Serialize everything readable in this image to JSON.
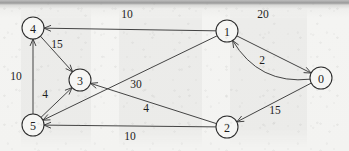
{
  "figure": {
    "kind": "directed-weighted-graph",
    "media": "scanned-book-page"
  },
  "nodes": [
    {
      "id": "0",
      "label": "0",
      "cx": 321,
      "cy": 78,
      "r": 11
    },
    {
      "id": "1",
      "label": "1",
      "cx": 227,
      "cy": 31,
      "r": 11
    },
    {
      "id": "2",
      "label": "2",
      "cx": 227,
      "cy": 127,
      "r": 11
    },
    {
      "id": "3",
      "label": "3",
      "cx": 80,
      "cy": 80,
      "r": 11
    },
    {
      "id": "4",
      "label": "4",
      "cx": 33,
      "cy": 28,
      "r": 11
    },
    {
      "id": "5",
      "label": "5",
      "cx": 33,
      "cy": 125,
      "r": 11
    }
  ],
  "edges": [
    {
      "id": "e-1-4",
      "from": "1",
      "to": "4",
      "weight": "10",
      "shape": "straight",
      "label_x": 127,
      "label_y": 14
    },
    {
      "id": "e-0-1",
      "from": "0",
      "to": "1",
      "weight": "20",
      "shape": "curved",
      "label_x": 263,
      "label_y": 14
    },
    {
      "id": "e-1-0",
      "from": "1",
      "to": "0",
      "weight": "2",
      "shape": "straight",
      "label_x": 262,
      "label_y": 60
    },
    {
      "id": "e-4-3",
      "from": "4",
      "to": "3",
      "weight": "15",
      "shape": "straight",
      "label_x": 57,
      "label_y": 44
    },
    {
      "id": "e-5-4",
      "from": "5",
      "to": "4",
      "weight": "10",
      "shape": "straight",
      "label_x": 16,
      "label_y": 76
    },
    {
      "id": "e-5-3",
      "from": "5",
      "to": "3",
      "weight": "4",
      "shape": "straight",
      "label_x": 45,
      "label_y": 94
    },
    {
      "id": "e-1-5",
      "from": "1",
      "to": "5",
      "weight": "30",
      "shape": "straight",
      "label_x": 136,
      "label_y": 84
    },
    {
      "id": "e-2-3",
      "from": "2",
      "to": "3",
      "weight": "4",
      "shape": "straight",
      "label_x": 146,
      "label_y": 108
    },
    {
      "id": "e-0-2",
      "from": "0",
      "to": "2",
      "weight": "15",
      "shape": "straight",
      "label_x": 275,
      "label_y": 110
    },
    {
      "id": "e-2-5",
      "from": "2",
      "to": "5",
      "weight": "10",
      "shape": "straight",
      "label_x": 130,
      "label_y": 136
    }
  ],
  "colors": {
    "ink": "#2b2b2b",
    "edge": "#3a3a3a",
    "paper": "#f3f3f1",
    "node_fill": "#f6f6f4"
  }
}
